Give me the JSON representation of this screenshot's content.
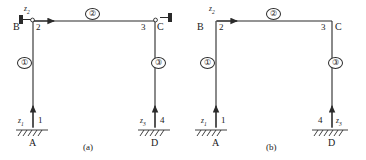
{
  "figure": {
    "type": "structural-frame-diagram"
  },
  "panels": [
    {
      "id": "a",
      "caption": "(a)",
      "supports_at_top": true,
      "beam_arrow_direction": "right",
      "joints": [
        {
          "name": "B",
          "position": "top-left"
        },
        {
          "name": "C",
          "position": "top-right"
        },
        {
          "name": "A",
          "position": "bottom-left"
        },
        {
          "name": "D",
          "position": "bottom-right"
        }
      ],
      "nodes": [
        {
          "number": "1",
          "position": "bottom-left"
        },
        {
          "number": "2",
          "position": "top-left"
        },
        {
          "number": "3",
          "position": "top-right"
        },
        {
          "number": "4",
          "position": "bottom-right"
        }
      ],
      "elements": [
        {
          "number": "①",
          "position": "left-column"
        },
        {
          "number": "②",
          "position": "beam"
        },
        {
          "number": "③",
          "position": "right-column"
        }
      ],
      "dofs": [
        {
          "label": "z",
          "sub": "1",
          "position": "bottom-left",
          "arrow": "up"
        },
        {
          "label": "z",
          "sub": "2",
          "position": "top-left",
          "arrow": "right"
        },
        {
          "label": "z",
          "sub": "3",
          "position": "bottom-right",
          "arrow": "up"
        }
      ]
    },
    {
      "id": "b",
      "caption": "(b)",
      "supports_at_top": false,
      "beam_arrow_direction": "right",
      "joints": [
        {
          "name": "B",
          "position": "top-left"
        },
        {
          "name": "C",
          "position": "top-right"
        },
        {
          "name": "A",
          "position": "bottom-left"
        },
        {
          "name": "D",
          "position": "bottom-right"
        }
      ],
      "nodes": [
        {
          "number": "1",
          "position": "bottom-left"
        },
        {
          "number": "2",
          "position": "top-left"
        },
        {
          "number": "3",
          "position": "top-right"
        },
        {
          "number": "4",
          "position": "bottom-right"
        }
      ],
      "elements": [
        {
          "number": "①",
          "position": "left-column"
        },
        {
          "number": "②",
          "position": "beam"
        },
        {
          "number": "③",
          "position": "right-column"
        }
      ],
      "dofs": [
        {
          "label": "z",
          "sub": "1",
          "position": "bottom-left",
          "arrow": "up"
        },
        {
          "label": "z",
          "sub": "2",
          "position": "top-left",
          "arrow": "right"
        },
        {
          "label": "z",
          "sub": "3",
          "position": "bottom-right",
          "arrow": "up"
        }
      ]
    }
  ],
  "colors": {
    "line": "#2a2a2a",
    "text": "#1a1a1a",
    "background": "#ffffff"
  }
}
